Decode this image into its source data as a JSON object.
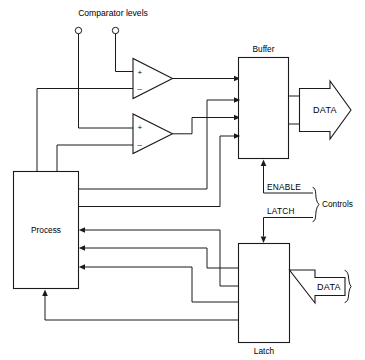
{
  "diagram": {
    "title": "Comparator levels",
    "blocks": [
      {
        "id": "process",
        "label": "Process"
      },
      {
        "id": "buffer",
        "label": "Buffer"
      },
      {
        "id": "latch",
        "label": "Latch"
      }
    ],
    "comparators": [
      {
        "id": "comparator-1",
        "plus": "+",
        "minus": "–"
      },
      {
        "id": "comparator-2",
        "plus": "+",
        "minus": "–"
      }
    ],
    "signals": {
      "enable": "ENABLE",
      "latch": "LATCH",
      "controls": "Controls",
      "data_out": "DATA",
      "data_in": "DATA"
    },
    "colors": {
      "line": "#1a1a1a",
      "background": "#ffffff",
      "text": "#000000"
    }
  }
}
